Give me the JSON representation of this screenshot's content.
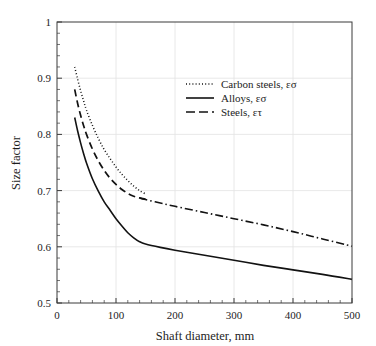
{
  "chart_data": {
    "type": "line",
    "title": "",
    "xlabel": "Shaft diameter, mm",
    "ylabel": "Size factor",
    "xlim": [
      0,
      500
    ],
    "ylim": [
      0.5,
      1
    ],
    "xticks": [
      0,
      100,
      200,
      300,
      400,
      500
    ],
    "yticks": [
      0.5,
      0.6,
      0.7,
      0.8,
      0.9,
      1
    ],
    "xtick_labels": [
      "0",
      "100",
      "200",
      "300",
      "400",
      "500"
    ],
    "ytick_labels": [
      "0.5",
      "0.6",
      "0.7",
      "0.8",
      "0.9",
      "1"
    ],
    "x_minor_step": 20,
    "y_minor_step": 0.02,
    "grid": true,
    "grid_color": "#e2e2e2",
    "frame_color": "#3a3a3a",
    "line_color": "#121212",
    "legend_position": "upper-center-right",
    "series": [
      {
        "name": "Carbon steels, εσ",
        "style": "dotted",
        "dasharray": "1,2.2",
        "width": 1.5,
        "x": [
          30,
          35,
          40,
          45,
          50,
          60,
          70,
          80,
          90,
          100,
          110,
          120,
          130,
          140,
          150
        ],
        "y": [
          0.92,
          0.898,
          0.878,
          0.86,
          0.843,
          0.816,
          0.793,
          0.773,
          0.757,
          0.742,
          0.729,
          0.718,
          0.708,
          0.7,
          0.694
        ]
      },
      {
        "name": "Steels, ετ",
        "style": "dashed",
        "dasharray": "7,4",
        "width": 1.7,
        "x": [
          30,
          35,
          40,
          45,
          50,
          60,
          70,
          80,
          90,
          100,
          110,
          120,
          130,
          140,
          150
        ],
        "y": [
          0.88,
          0.855,
          0.834,
          0.816,
          0.8,
          0.774,
          0.753,
          0.736,
          0.722,
          0.711,
          0.702,
          0.695,
          0.69,
          0.687,
          0.685
        ]
      },
      {
        "name": "Alloys, εσ",
        "style": "solid",
        "dasharray": "none",
        "width": 1.6,
        "x": [
          30,
          35,
          40,
          45,
          50,
          60,
          70,
          80,
          90,
          100,
          110,
          120,
          130,
          140,
          150,
          175,
          200,
          250,
          300,
          350,
          400,
          450,
          500
        ],
        "y": [
          0.83,
          0.806,
          0.785,
          0.766,
          0.749,
          0.721,
          0.699,
          0.68,
          0.665,
          0.65,
          0.637,
          0.625,
          0.616,
          0.609,
          0.605,
          0.599,
          0.594,
          0.585,
          0.576,
          0.567,
          0.559,
          0.551,
          0.542
        ]
      },
      {
        "name": "merged-upper",
        "style": "dashdot",
        "dasharray": "8,3,1.5,3",
        "width": 1.6,
        "x": [
          140,
          150,
          175,
          200,
          250,
          300,
          350,
          400,
          450,
          500
        ],
        "y": [
          0.687,
          0.684,
          0.678,
          0.672,
          0.661,
          0.65,
          0.639,
          0.627,
          0.614,
          0.601
        ]
      }
    ],
    "legend": [
      {
        "label": "Carbon steels, εσ",
        "style": "dotted"
      },
      {
        "label": "Alloys, εσ",
        "style": "solid"
      },
      {
        "label": "Steels, ετ",
        "style": "dashed"
      }
    ]
  },
  "plot_geometry": {
    "left": 57,
    "right": 352,
    "top": 22,
    "bottom": 303
  }
}
